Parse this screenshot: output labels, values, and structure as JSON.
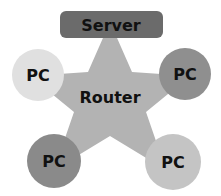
{
  "diagram": {
    "type": "star-topology",
    "hub": {
      "label": "Router",
      "color": "#b3b3b3"
    },
    "server": {
      "label": "Server",
      "color": "#6b6b6b"
    },
    "nodes": [
      {
        "label": "PC",
        "position": "top-left",
        "color": "#e0e0e0"
      },
      {
        "label": "PC",
        "position": "top-right",
        "color": "#8f8f8f"
      },
      {
        "label": "PC",
        "position": "bottom-left",
        "color": "#8a8a8a"
      },
      {
        "label": "PC",
        "position": "bottom-right",
        "color": "#c4c4c4"
      }
    ]
  }
}
